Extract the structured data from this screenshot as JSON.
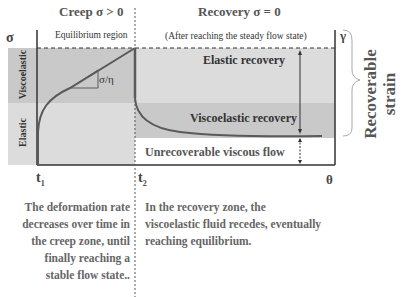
{
  "headers": {
    "creep": "Creep σ > 0",
    "recovery": "Recovery σ = 0"
  },
  "region_labels": {
    "equilibrium": "Equilibrium region",
    "steady_flow_note": "(After reaching the steady flow state)",
    "slope": "σ/η",
    "elastic_recovery": "Elastic recovery",
    "viscoelastic_recovery": "Viscoelastic recovery",
    "unrecoverable": "Unrecoverable viscous flow"
  },
  "band_labels": {
    "viscoelastic": "Viscoelastic",
    "elastic": "Elastic"
  },
  "axes": {
    "y_left": "σ",
    "y_right": "γ",
    "x_t1": "t",
    "x_t1_sub": "1",
    "x_t2": "t",
    "x_t2_sub": "2",
    "x_end": "θ"
  },
  "side_label": {
    "line1": "Recoverable",
    "line2": "strain"
  },
  "descriptions": {
    "creep": [
      "The deformation rate",
      "decreases over time in",
      "the creep zone, until",
      "finally reaching a",
      "stable flow state.."
    ],
    "recovery": [
      "In the recovery zone, the",
      "viscoelastic fluid recedes, eventually",
      "reaching equilibrium."
    ]
  },
  "colors": {
    "band_dark": "#c9c9c9",
    "band_light": "#dcdcdc",
    "curve": "#5a5a5a",
    "axis": "#333333"
  }
}
